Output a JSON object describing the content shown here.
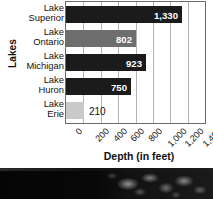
{
  "chart_data": {
    "type": "bar",
    "orientation": "horizontal",
    "title": "",
    "xlabel": "Depth (in feet)",
    "ylabel": "Lakes",
    "categories": [
      "Lake Superior",
      "Lake Ontario",
      "Lake Michigan",
      "Lake Huron",
      "Lake Erie"
    ],
    "category_lines": [
      {
        "line1": "Lake",
        "line2": "Superior"
      },
      {
        "line1": "Lake",
        "line2": "Ontario"
      },
      {
        "line1": "Lake",
        "line2": "Michigan"
      },
      {
        "line1": "Lake",
        "line2": "Huron"
      },
      {
        "line1": "Lake",
        "line2": "Erie"
      }
    ],
    "values": [
      1330,
      802,
      923,
      750,
      210
    ],
    "value_labels": [
      "1,330",
      "802",
      "923",
      "750",
      "210"
    ],
    "bar_colors": [
      "#1b1b1b",
      "#6e6e6e",
      "#1b1b1b",
      "#1b1b1b",
      "#c9c9c9"
    ],
    "label_colors": [
      "#ffffff",
      "#ffffff",
      "#ffffff",
      "#ffffff",
      "#111111"
    ],
    "label_inside": [
      true,
      true,
      true,
      true,
      false
    ],
    "xlim": [
      0,
      1600
    ],
    "xticks": [
      0,
      200,
      400,
      600,
      800,
      1000,
      1200,
      1400,
      1600
    ],
    "xtick_labels": [
      "0",
      "200",
      "400",
      "600",
      "800",
      "1,000",
      "1,200",
      "1,400",
      "1,600"
    ],
    "xtick_rotation_deg": -45,
    "grid": "vertical",
    "grid_color": "#b4b4b4",
    "legend": "none",
    "plot_border_color": "#6a6a6a",
    "background": "#ffffff"
  },
  "photo_strip": {
    "description": "dark grayscale foliage photograph band",
    "background_color": "#0a0a0a"
  }
}
